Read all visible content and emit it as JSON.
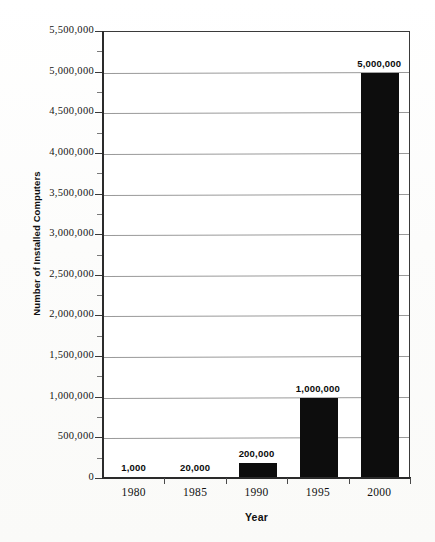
{
  "chart_data": {
    "type": "bar",
    "title": "",
    "categories": [
      "1980",
      "1985",
      "1990",
      "1995",
      "2000"
    ],
    "values": [
      1000,
      20000,
      200000,
      1000000,
      5000000
    ],
    "value_labels": [
      "1,000",
      "20,000",
      "200,000",
      "1,000,000",
      "5,000,000"
    ],
    "xlabel": "Year",
    "ylabel": "Number of Installed Computers",
    "ylim": [
      0,
      5500000
    ],
    "ytick_values": [
      0,
      500000,
      1000000,
      1500000,
      2000000,
      2500000,
      3000000,
      3500000,
      4000000,
      4500000,
      5000000,
      5500000
    ],
    "ytick_labels": [
      "0",
      "500,000",
      "1,000,000",
      "1,500,000",
      "2,000,000",
      "2,500,000",
      "3,000,000",
      "3,500,000",
      "4,000,000",
      "4,500,000",
      "5,000,000",
      "5,500,000"
    ],
    "minor_tick_interval": 250000,
    "grid": true,
    "grid_axis": "y",
    "legend": "none",
    "bar_color": "#0d0d0d",
    "grid_color": "#9a9a9a",
    "axis_color": "#2b2b2b",
    "background_color": "#ffffff"
  }
}
